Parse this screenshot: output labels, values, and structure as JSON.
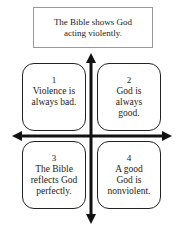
{
  "top_box": {
    "text_line1": "The Bible shows God",
    "text_line2": "acting violently."
  },
  "quadrants": [
    {
      "number": "1",
      "lines": [
        "Violence is",
        "always bad."
      ]
    },
    {
      "number": "2",
      "lines": [
        "God is",
        "always",
        "good."
      ]
    },
    {
      "number": "3",
      "lines": [
        "The Bible",
        "reflects God",
        "perfectly."
      ]
    },
    {
      "number": "4",
      "lines": [
        "A good",
        "God is",
        "nonviolent."
      ]
    }
  ],
  "colors": {
    "stroke": "#111111",
    "top_border": "#999999",
    "text": "#222222"
  }
}
